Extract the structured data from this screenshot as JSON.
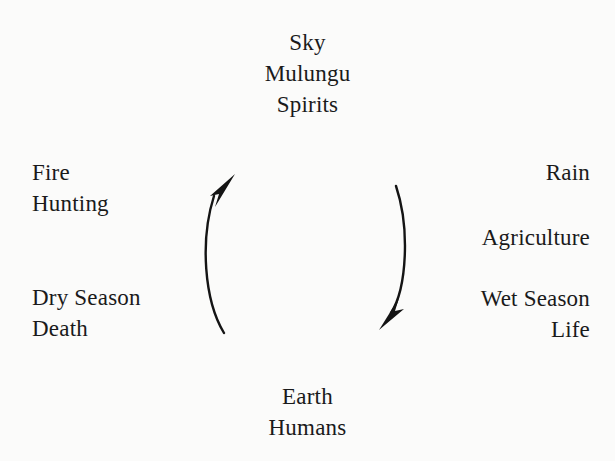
{
  "diagram": {
    "type": "cycle",
    "background_color": "#fbfbfa",
    "text_color": "#1a1a1a",
    "poles": {
      "top": {
        "lines": [
          "Sky",
          "Mulungu",
          "Spirits"
        ],
        "line1": "Sky",
        "line2": "Mulungu",
        "line3": "Spirits"
      },
      "bottom": {
        "lines": [
          "Earth",
          "Humans"
        ],
        "line1": "Earth",
        "line2": "Humans"
      }
    },
    "left_side": {
      "upper": {
        "line1": "Fire",
        "line2": "Hunting"
      },
      "lower": {
        "line1": "Dry Season",
        "line2": "Death"
      }
    },
    "right_side": {
      "upper": {
        "line1": "Rain"
      },
      "middle": {
        "line1": "Agriculture"
      },
      "lower": {
        "line1": "Wet Season",
        "line2": "Life"
      }
    },
    "arrows": [
      {
        "name": "ascending-arrow",
        "direction": "upward",
        "from": "Earth",
        "to": "Sky",
        "side": "left",
        "color": "#141414"
      },
      {
        "name": "descending-arrow",
        "direction": "downward",
        "from": "Sky",
        "to": "Earth",
        "side": "right",
        "color": "#141414"
      }
    ]
  }
}
